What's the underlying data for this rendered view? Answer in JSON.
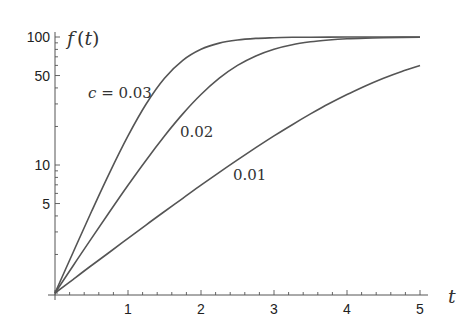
{
  "chart_data": {
    "type": "line",
    "title": "",
    "xlabel": "t",
    "ylabel": "f(t)",
    "xlim": [
      0,
      5
    ],
    "ylim": [
      1,
      100
    ],
    "yscale": "log",
    "grid": false,
    "legend": "inline labels",
    "x_ticks": [
      1,
      2,
      3,
      4,
      5
    ],
    "y_ticks": [
      5,
      10,
      50,
      100
    ],
    "x": [
      0,
      0.25,
      0.5,
      0.75,
      1,
      1.25,
      1.5,
      1.75,
      2,
      2.25,
      2.5,
      2.75,
      3,
      3.25,
      3.5,
      3.75,
      4,
      4.25,
      4.5,
      4.75,
      5
    ],
    "series": [
      {
        "name": "c = 0.03",
        "label": "c = 0.03",
        "values": [
          1,
          2.09,
          4.33,
          8.75,
          16.87,
          30.06,
          47.62,
          65.8,
          80.3,
          89.6,
          94.8,
          97.5,
          98.8,
          99.43,
          99.7,
          99.87,
          99.94,
          99.97,
          99.99,
          99.99,
          100
        ]
      },
      {
        "name": "c = 0.02",
        "label": "0.02",
        "values": [
          1,
          1.64,
          2.67,
          4.33,
          6.95,
          10.96,
          16.87,
          25.06,
          35.55,
          47.62,
          60.0,
          71.2,
          80.3,
          87.1,
          91.7,
          94.8,
          96.8,
          98.0,
          98.8,
          99.26,
          99.55
        ]
      },
      {
        "name": "c = 0.01",
        "label": "0.01",
        "values": [
          1,
          1.28,
          1.64,
          2.09,
          2.67,
          3.41,
          4.33,
          5.49,
          6.95,
          8.75,
          10.96,
          13.65,
          16.87,
          20.66,
          25.06,
          30.06,
          35.55,
          41.46,
          47.62,
          53.88,
          60.0
        ]
      }
    ],
    "annotations": [
      {
        "text": "c = 0.03",
        "x_px": 88,
        "y_px": 98
      },
      {
        "text": "0.02",
        "x_px": 180,
        "y_px": 137
      },
      {
        "text": "0.01",
        "x_px": 233,
        "y_px": 180
      }
    ],
    "colors": {
      "curve": "#555555",
      "axis": "#555555",
      "text": "#222222"
    }
  },
  "labels": {
    "y_axis_f": "f",
    "y_axis_paren_open": "(",
    "y_axis_t": "t",
    "y_axis_paren_close": ")",
    "x_axis_t": "t",
    "ann_c": "c",
    "ann_eq": " = 0.03",
    "ann_002": "0.02",
    "ann_001": "0.01",
    "xt1": "1",
    "xt2": "2",
    "xt3": "3",
    "xt4": "4",
    "xt5": "5",
    "yt100": "100",
    "yt50": "50",
    "yt10": "10",
    "yt5": "5"
  }
}
